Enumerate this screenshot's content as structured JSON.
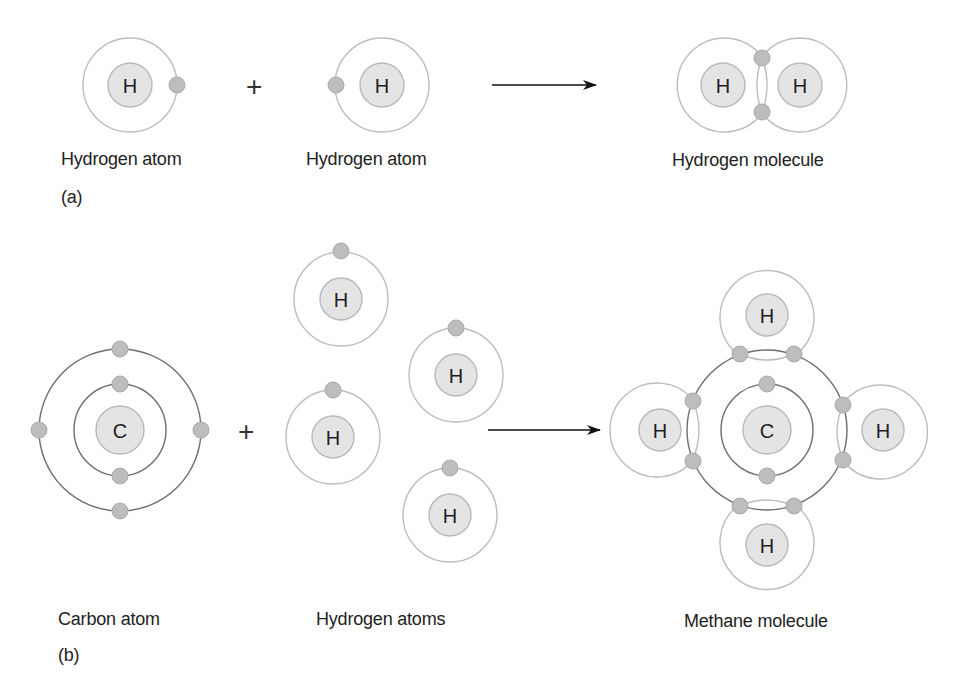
{
  "figure": {
    "part_a": {
      "tag": "(a)",
      "reactant_1_label": "Hydrogen atom",
      "reactant_2_label": "Hydrogen atom",
      "operator": "+",
      "product_label": "Hydrogen molecule",
      "atoms": [
        {
          "symbol": "H",
          "cx": 130,
          "cy": 85,
          "electrons": [
            [
              177,
              85
            ]
          ]
        },
        {
          "symbol": "H",
          "cx": 382,
          "cy": 85,
          "electrons": [
            [
              336,
              85
            ]
          ]
        }
      ],
      "molecule": {
        "atoms": [
          {
            "symbol": "H",
            "cx": 723,
            "cy": 85
          },
          {
            "symbol": "H",
            "cx": 800,
            "cy": 85
          }
        ],
        "shared_electrons": [
          [
            762,
            57
          ],
          [
            762,
            113
          ]
        ]
      }
    },
    "part_b": {
      "tag": "(b)",
      "reactant_1_label": "Carbon atom",
      "reactant_2_label": "Hydrogen atoms",
      "operator": "+",
      "product_label": "Methane molecule",
      "carbon": {
        "symbol": "C",
        "cx": 120,
        "cy": 430,
        "inner_electrons": 2,
        "outer_electrons": 4
      },
      "hydrogens": [
        {
          "symbol": "H",
          "cx": 341,
          "cy": 299
        },
        {
          "symbol": "H",
          "cx": 456,
          "cy": 375
        },
        {
          "symbol": "H",
          "cx": 333,
          "cy": 437
        },
        {
          "symbol": "H",
          "cx": 450,
          "cy": 515
        }
      ],
      "methane": {
        "center": {
          "symbol": "C",
          "cx": 767,
          "cy": 430
        },
        "hydrogens": [
          {
            "symbol": "H",
            "position": "top"
          },
          {
            "symbol": "H",
            "position": "left"
          },
          {
            "symbol": "H",
            "position": "right"
          },
          {
            "symbol": "H",
            "position": "bottom"
          }
        ]
      }
    },
    "arrow_label": "",
    "colors": {
      "nucleus_fill": "#e4e4e4",
      "electron_fill": "#bdbdbd",
      "hydrogen_orbit": "#bdbdbd",
      "carbon_orbit": "#6e6e6e",
      "text": "#222222"
    }
  }
}
